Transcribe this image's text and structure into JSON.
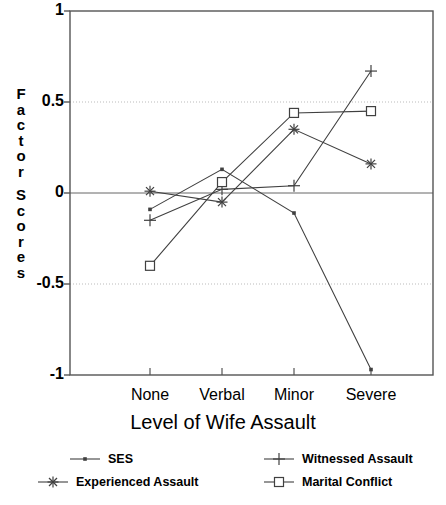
{
  "chart_data": {
    "type": "line",
    "title": "",
    "subtitle": "",
    "xlabel": "Level of Wife Assault",
    "ylabel": "Factor Scores",
    "categories": [
      "None",
      "Verbal",
      "Minor",
      "Severe"
    ],
    "ylim": [
      -1,
      1
    ],
    "yticks": [
      1,
      0.5,
      0,
      -0.5,
      -1
    ],
    "ytick_labels": [
      "1",
      "0.5",
      "0",
      "-0.5",
      "-1"
    ],
    "grid": "horizontal dotted gridlines at 0.5 and -0.5; solid zero line at 0",
    "legend_position": "below-plot",
    "series": [
      {
        "name": "SES",
        "marker": "dot",
        "values": [
          -0.09,
          0.13,
          -0.11,
          -0.97
        ]
      },
      {
        "name": "Witnessed Assault",
        "marker": "plus",
        "values": [
          -0.15,
          0.02,
          0.04,
          0.67
        ]
      },
      {
        "name": "Experienced Assault",
        "marker": "asterisk",
        "values": [
          0.01,
          -0.05,
          0.35,
          0.16
        ]
      },
      {
        "name": "Marital Conflict",
        "marker": "square",
        "values": [
          -0.4,
          0.06,
          0.44,
          0.45
        ]
      }
    ]
  },
  "axis": {
    "y_label_word1": "Factor",
    "y_label_word2": "Scores"
  },
  "legend": {
    "items": [
      {
        "label": "SES",
        "marker": "dot"
      },
      {
        "label": "Witnessed Assault",
        "marker": "plus"
      },
      {
        "label": "Experienced Assault",
        "marker": "asterisk"
      },
      {
        "label": "Marital Conflict",
        "marker": "square"
      }
    ]
  },
  "colors": {
    "line": "#404040",
    "axis": "#555555",
    "grid": "#bbbbbb",
    "zero_line": "#666666",
    "text": "#000000",
    "background": "#ffffff"
  }
}
